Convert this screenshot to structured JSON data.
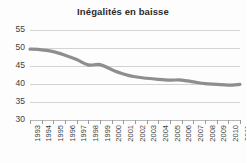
{
  "chart_data": {
    "type": "line",
    "title": "Inégalités en baisse",
    "xlabel": "",
    "ylabel": "",
    "grid": true,
    "legend": null,
    "line_color": "#8e8e8e",
    "x": [
      1993,
      1994,
      1995,
      1996,
      1997,
      1998,
      1999,
      2000,
      2001,
      2002,
      2003,
      2004,
      2005,
      2006,
      2007,
      2008,
      2009,
      2010,
      2011
    ],
    "categories": [
      "1993",
      "1994",
      "1995",
      "1996",
      "1997",
      "1998",
      "1999",
      "2000",
      "2001",
      "2002",
      "2003",
      "2004",
      "2005",
      "2006",
      "2007",
      "2008",
      "2009",
      "2010",
      "2011"
    ],
    "values": [
      49.7,
      49.5,
      49.0,
      48.0,
      46.8,
      45.3,
      45.4,
      44.0,
      42.8,
      42.0,
      41.6,
      41.3,
      41.1,
      41.1,
      40.6,
      40.1,
      39.9,
      39.7,
      39.9
    ],
    "ylim": [
      30,
      55
    ],
    "yticks": [
      30,
      35,
      40,
      45,
      50,
      55
    ],
    "ytick_labels": [
      "30",
      "35",
      "40",
      "45",
      "50",
      "55"
    ],
    "xlim": [
      1993,
      2011
    ]
  }
}
